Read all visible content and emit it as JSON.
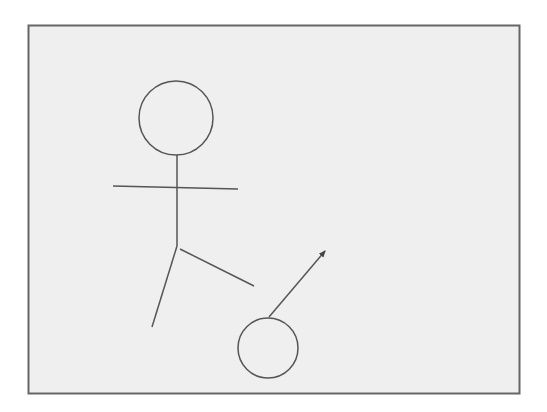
{
  "diagram": {
    "colors": {
      "background": "#ffffff",
      "panel_fill": "#efefef",
      "panel_border": "#666666",
      "stroke": "#555555"
    },
    "elements": [
      {
        "name": "stick-figure-head",
        "kind": "circle"
      },
      {
        "name": "stick-figure-body",
        "kind": "line"
      },
      {
        "name": "stick-figure-arms",
        "kind": "line"
      },
      {
        "name": "stick-figure-left-leg",
        "kind": "line"
      },
      {
        "name": "stick-figure-right-leg",
        "kind": "line"
      },
      {
        "name": "ball",
        "kind": "circle"
      },
      {
        "name": "motion-arrow",
        "kind": "arrow"
      }
    ]
  }
}
